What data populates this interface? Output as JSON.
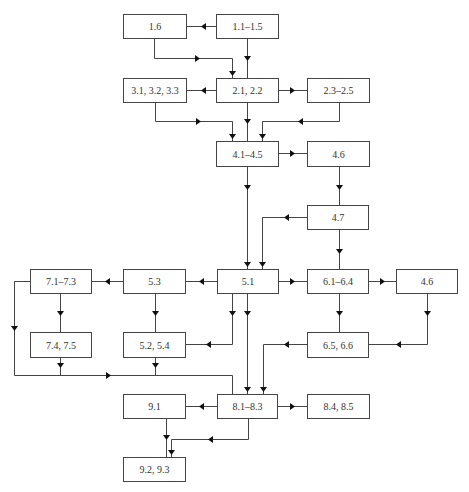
{
  "diagram": {
    "type": "flowchart",
    "nodes": [
      {
        "id": "n1_6",
        "label": "1.6",
        "x": 123,
        "y": 14,
        "w": 63,
        "h": 24
      },
      {
        "id": "n1_1",
        "label": "1.1–1.5",
        "x": 216,
        "y": 14,
        "w": 62,
        "h": 24
      },
      {
        "id": "n3_1",
        "label": "3.1, 3.2, 3.3",
        "x": 123,
        "y": 78,
        "w": 63,
        "h": 24
      },
      {
        "id": "n2_1",
        "label": "2.1, 2.2",
        "x": 216,
        "y": 78,
        "w": 62,
        "h": 24
      },
      {
        "id": "n2_3",
        "label": "2.3–2.5",
        "x": 307,
        "y": 78,
        "w": 62,
        "h": 24
      },
      {
        "id": "n4_1",
        "label": "4.1–4.5",
        "x": 216,
        "y": 141,
        "w": 62,
        "h": 25
      },
      {
        "id": "n4_6a",
        "label": "4.6",
        "x": 307,
        "y": 141,
        "w": 62,
        "h": 25
      },
      {
        "id": "n4_7",
        "label": "4.7",
        "x": 307,
        "y": 205,
        "w": 61,
        "h": 24
      },
      {
        "id": "n7_1",
        "label": "7.1–7.3",
        "x": 30,
        "y": 269,
        "w": 61,
        "h": 24
      },
      {
        "id": "n5_3",
        "label": "5.3",
        "x": 123,
        "y": 269,
        "w": 62,
        "h": 24
      },
      {
        "id": "n5_1",
        "label": "5.1",
        "x": 217,
        "y": 269,
        "w": 61,
        "h": 24
      },
      {
        "id": "n6_1",
        "label": "6.1–6.4",
        "x": 307,
        "y": 269,
        "w": 61,
        "h": 24
      },
      {
        "id": "n4_6b",
        "label": "4.6",
        "x": 396,
        "y": 269,
        "w": 61,
        "h": 24
      },
      {
        "id": "n7_4",
        "label": "7.4, 7.5",
        "x": 30,
        "y": 332,
        "w": 61,
        "h": 25
      },
      {
        "id": "n5_2",
        "label": "5.2, 5.4",
        "x": 123,
        "y": 332,
        "w": 62,
        "h": 25
      },
      {
        "id": "n6_5",
        "label": "6.5, 6.6",
        "x": 307,
        "y": 332,
        "w": 61,
        "h": 25
      },
      {
        "id": "n9_1",
        "label": "9.1",
        "x": 123,
        "y": 394,
        "w": 62,
        "h": 24
      },
      {
        "id": "n8_1",
        "label": "8.1–8.3",
        "x": 217,
        "y": 394,
        "w": 60,
        "h": 24
      },
      {
        "id": "n8_4",
        "label": "8.4, 8.5",
        "x": 307,
        "y": 394,
        "w": 62,
        "h": 24
      },
      {
        "id": "n9_2",
        "label": "9.2, 9.3",
        "x": 123,
        "y": 457,
        "w": 62,
        "h": 24
      }
    ],
    "edges": [
      {
        "from": "n1_1",
        "to": "n1_6",
        "points": [
          [
            216,
            26
          ],
          [
            186,
            26
          ]
        ],
        "arrow": [
          203,
          26,
          "left"
        ]
      },
      {
        "from": "n1_1",
        "to": "n2_1",
        "points": [
          [
            247,
            38
          ],
          [
            247,
            78
          ]
        ],
        "arrow": [
          247,
          58,
          "down"
        ]
      },
      {
        "from": "n1_6",
        "to": "n2_1",
        "points": [
          [
            154,
            38
          ],
          [
            154,
            58
          ],
          [
            232,
            58
          ],
          [
            232,
            78
          ]
        ],
        "arrow": [
          197,
          58,
          "right"
        ],
        "arrow2": [
          232,
          73,
          "down"
        ]
      },
      {
        "from": "n2_1",
        "to": "n3_1",
        "points": [
          [
            216,
            90
          ],
          [
            186,
            90
          ]
        ],
        "arrow": [
          203,
          90,
          "left"
        ]
      },
      {
        "from": "n2_1",
        "to": "n2_3",
        "points": [
          [
            278,
            90
          ],
          [
            307,
            90
          ]
        ],
        "arrow": [
          292,
          90,
          "right"
        ]
      },
      {
        "from": "n2_1",
        "to": "n4_1",
        "points": [
          [
            247,
            102
          ],
          [
            247,
            141
          ]
        ],
        "arrow": [
          247,
          121,
          "down"
        ]
      },
      {
        "from": "n3_1",
        "to": "n4_1",
        "points": [
          [
            155,
            102
          ],
          [
            155,
            121
          ],
          [
            232,
            121
          ],
          [
            232,
            141
          ]
        ],
        "arrow": [
          198,
          121,
          "right"
        ],
        "arrow2": [
          232,
          136,
          "down"
        ]
      },
      {
        "from": "n2_3",
        "to": "n4_1",
        "points": [
          [
            339,
            102
          ],
          [
            339,
            121
          ],
          [
            262,
            121
          ],
          [
            262,
            141
          ]
        ],
        "arrow": [
          300,
          121,
          "left"
        ],
        "arrow2": [
          262,
          136,
          "down"
        ]
      },
      {
        "from": "n4_1",
        "to": "n4_6a",
        "points": [
          [
            278,
            153
          ],
          [
            307,
            153
          ]
        ],
        "arrow": [
          292,
          153,
          "right"
        ]
      },
      {
        "from": "n4_1",
        "to": "n5_1",
        "points": [
          [
            247,
            166
          ],
          [
            247,
            269
          ]
        ],
        "arrow": [
          247,
          187,
          "down"
        ],
        "arrow2": [
          247,
          264,
          "down"
        ]
      },
      {
        "from": "n4_6a",
        "to": "n4_7",
        "points": [
          [
            339,
            166
          ],
          [
            339,
            205
          ]
        ],
        "arrow": [
          339,
          187,
          "down"
        ]
      },
      {
        "from": "n4_7",
        "to": "n5_1",
        "points": [
          [
            307,
            217
          ],
          [
            262,
            217
          ],
          [
            262,
            269
          ]
        ],
        "arrow": [
          286,
          217,
          "left"
        ],
        "arrow2": [
          262,
          264,
          "down"
        ]
      },
      {
        "from": "n4_7",
        "to": "n6_1",
        "points": [
          [
            339,
            229
          ],
          [
            339,
            269
          ]
        ],
        "arrow": [
          339,
          251,
          "down"
        ]
      },
      {
        "from": "n5_1",
        "to": "n5_3",
        "points": [
          [
            217,
            281
          ],
          [
            185,
            281
          ]
        ],
        "arrow": [
          201,
          281,
          "left"
        ]
      },
      {
        "from": "n5_3",
        "to": "n7_1",
        "points": [
          [
            123,
            281
          ],
          [
            91,
            281
          ]
        ],
        "arrow": [
          107,
          281,
          "left"
        ]
      },
      {
        "from": "n5_1",
        "to": "n6_1",
        "points": [
          [
            278,
            281
          ],
          [
            307,
            281
          ]
        ],
        "arrow": [
          292,
          281,
          "right"
        ]
      },
      {
        "from": "n6_1",
        "to": "n4_6b",
        "points": [
          [
            368,
            281
          ],
          [
            396,
            281
          ]
        ],
        "arrow": [
          382,
          281,
          "right"
        ]
      },
      {
        "from": "n7_1",
        "to": "n7_4",
        "points": [
          [
            60,
            293
          ],
          [
            60,
            332
          ]
        ],
        "arrow": [
          60,
          313,
          "down"
        ]
      },
      {
        "from": "n5_3",
        "to": "n5_2",
        "points": [
          [
            155,
            293
          ],
          [
            155,
            332
          ]
        ],
        "arrow": [
          155,
          313,
          "down"
        ]
      },
      {
        "from": "n5_1",
        "to": "n5_2",
        "points": [
          [
            232,
            293
          ],
          [
            232,
            344
          ],
          [
            185,
            344
          ]
        ],
        "arrow": [
          232,
          313,
          "down"
        ],
        "arrow2": [
          208,
          344,
          "left"
        ]
      },
      {
        "from": "n6_1",
        "to": "n6_5",
        "points": [
          [
            339,
            293
          ],
          [
            339,
            332
          ]
        ],
        "arrow": [
          339,
          313,
          "down"
        ]
      },
      {
        "from": "n4_6b",
        "to": "n6_5",
        "points": [
          [
            427,
            293
          ],
          [
            427,
            344
          ],
          [
            368,
            344
          ]
        ],
        "arrow": [
          427,
          313,
          "down"
        ],
        "arrow2": [
          398,
          344,
          "left"
        ]
      },
      {
        "from": "n7_1",
        "to": "n8_1",
        "points": [
          [
            30,
            281
          ],
          [
            14,
            281
          ],
          [
            14,
            375
          ],
          [
            232,
            375
          ],
          [
            232,
            394
          ]
        ],
        "arrow": [
          14,
          328,
          "down"
        ],
        "arrow2": [
          108,
          375,
          "right"
        ]
      },
      {
        "from": "n7_4",
        "to": "n8_1",
        "points": [
          [
            60,
            357
          ],
          [
            60,
            375
          ]
        ],
        "arrow": [
          60,
          365,
          "down"
        ]
      },
      {
        "from": "n5_2",
        "to": "n8_1",
        "points": [
          [
            155,
            357
          ],
          [
            155,
            375
          ]
        ],
        "arrow": [
          155,
          365,
          "down"
        ]
      },
      {
        "from": "n5_1",
        "to": "n8_1",
        "points": [
          [
            247,
            293
          ],
          [
            247,
            394
          ]
        ],
        "arrow": [
          247,
          313,
          "down"
        ],
        "arrow2": [
          247,
          389,
          "down"
        ]
      },
      {
        "from": "n6_5",
        "to": "n8_1",
        "points": [
          [
            307,
            344
          ],
          [
            263,
            344
          ],
          [
            263,
            394
          ]
        ],
        "arrow": [
          286,
          344,
          "left"
        ],
        "arrow2": [
          263,
          389,
          "down"
        ]
      },
      {
        "from": "n8_1",
        "to": "n9_1",
        "points": [
          [
            217,
            406
          ],
          [
            185,
            406
          ]
        ],
        "arrow": [
          201,
          406,
          "left"
        ]
      },
      {
        "from": "n8_1",
        "to": "n8_4",
        "points": [
          [
            277,
            406
          ],
          [
            307,
            406
          ]
        ],
        "arrow": [
          292,
          406,
          "right"
        ]
      },
      {
        "from": "n9_1",
        "to": "n9_2",
        "points": [
          [
            166,
            418
          ],
          [
            166,
            457
          ]
        ],
        "arrow": [
          166,
          437,
          "down"
        ]
      },
      {
        "from": "n8_1",
        "to": "n9_2",
        "points": [
          [
            248,
            418
          ],
          [
            248,
            439
          ],
          [
            171,
            439
          ],
          [
            171,
            457
          ]
        ],
        "arrow": [
          210,
          439,
          "left"
        ],
        "arrow2": [
          171,
          452,
          "down"
        ]
      }
    ]
  }
}
